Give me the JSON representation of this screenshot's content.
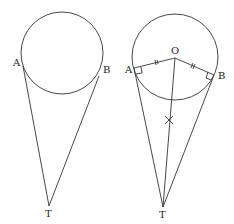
{
  "figures": [
    {
      "name": "left",
      "labels": {
        "A": "A",
        "B": "B",
        "T": "T"
      }
    },
    {
      "name": "right",
      "labels": {
        "A": "A",
        "B": "B",
        "O": "O",
        "T": "T"
      }
    }
  ]
}
